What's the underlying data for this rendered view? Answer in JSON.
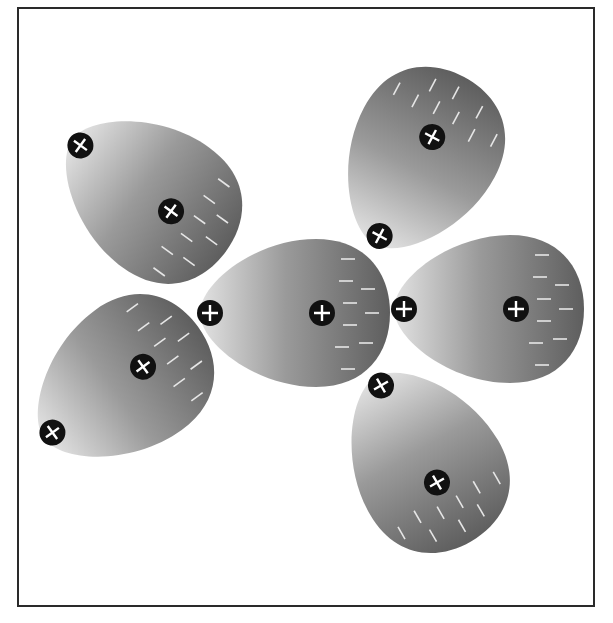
{
  "diagram": {
    "title": "",
    "colors": {
      "background": "#ffffff",
      "frame": "#2a2a2a",
      "molecule_light": "#e2e2e2",
      "molecule_mid": "#9a9a9a",
      "molecule_dark": "#5e5e5e",
      "charge_badge": "#111111",
      "charge_symbol": "#ffffff",
      "negative_dash": "#e6e6e6"
    },
    "legend": {
      "positive_symbol": "+",
      "negative_symbol": "−"
    },
    "molecules": [
      {
        "id": "center",
        "positive_charges": 2,
        "negative_dashes": 9,
        "orientation": "negative end right"
      },
      {
        "id": "right",
        "positive_charges": 2,
        "negative_dashes": 9,
        "orientation": "negative end right"
      },
      {
        "id": "upper-left",
        "positive_charges": 2,
        "negative_dashes": 9,
        "orientation": "negative end lower-right"
      },
      {
        "id": "lower-left",
        "positive_charges": 2,
        "negative_dashes": 9,
        "orientation": "negative end upper-right"
      },
      {
        "id": "top-right",
        "positive_charges": 2,
        "negative_dashes": 9,
        "orientation": "negative end top"
      },
      {
        "id": "bottom-right",
        "positive_charges": 2,
        "negative_dashes": 9,
        "orientation": "negative end bottom"
      }
    ]
  }
}
